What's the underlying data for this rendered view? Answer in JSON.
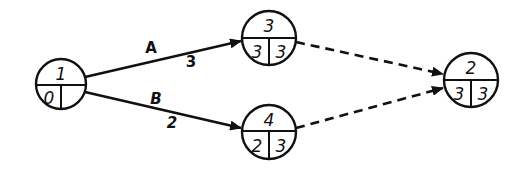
{
  "diagram": {
    "type": "activity-on-arrow network",
    "nodes": [
      {
        "id": "1",
        "cx": 61,
        "cy": 84,
        "r": 25,
        "label": "1",
        "left": "0",
        "right": ""
      },
      {
        "id": "3",
        "cx": 269,
        "cy": 38,
        "r": 27,
        "label": "3",
        "left": "3",
        "right": "3"
      },
      {
        "id": "4",
        "cx": 269,
        "cy": 132,
        "r": 27,
        "label": "4",
        "left": "2",
        "right": "3"
      },
      {
        "id": "2",
        "cx": 471,
        "cy": 80,
        "r": 27,
        "label": "2",
        "left": "3",
        "right": "3"
      }
    ],
    "edges": [
      {
        "from": "1",
        "to": "3",
        "name": "A",
        "duration": "3",
        "style": "solid"
      },
      {
        "from": "1",
        "to": "4",
        "name": "B",
        "duration": "2",
        "style": "solid"
      },
      {
        "from": "3",
        "to": "2",
        "name": "",
        "duration": "",
        "style": "dashed"
      },
      {
        "from": "4",
        "to": "2",
        "name": "",
        "duration": "",
        "style": "dashed"
      }
    ]
  },
  "colors": {
    "ink": "#111111",
    "background": "#ffffff"
  }
}
